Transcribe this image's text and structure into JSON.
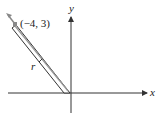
{
  "diagram": {
    "axes": {
      "x_label": "x",
      "y_label": "y"
    },
    "vector": {
      "name_label": "r",
      "point_label": "(−4, 3)",
      "point": [
        -4,
        3
      ]
    },
    "colors": {
      "axis": "#333333",
      "vector_outline": "#333333",
      "vector_fill": "#ffffff",
      "point": "#888888"
    }
  }
}
